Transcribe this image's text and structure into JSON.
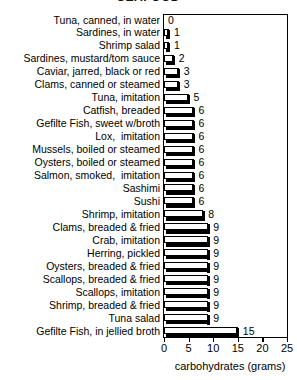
{
  "chart_data": {
    "type": "bar",
    "orientation": "horizontal",
    "title": "SEAFOOD",
    "title_cropped": true,
    "xlabel": "carbohydrates (grams)",
    "ylabel": "",
    "xlim": [
      0,
      25
    ],
    "xticks": [
      0,
      5,
      10,
      15,
      20,
      25
    ],
    "grid": false,
    "legend": false,
    "categories": [
      "Tuna, canned, in water",
      "Sardines, in water",
      "Shrimp salad",
      "Sardines, mustard/tom sauce",
      "Caviar, jarred, black or red",
      "Clams, canned or steamed",
      "Tuna, imitation",
      "Catfish, breaded",
      "Gefilte Fish, sweet w/broth",
      "Lox,  imitation",
      "Mussels, boiled or steamed",
      "Oysters, boiled or steamed",
      "Salmon, smoked,  imitation",
      "Sashimi",
      "Sushi",
      "Shrimp, imitation",
      "Clams, breaded & fried",
      "Crab, imitation",
      "Herring, pickled",
      "Oysters, breaded & fried",
      "Scallops, breaded & fried",
      "Scallops, imitation",
      "Shrimp, breaded & fried",
      "Tuna salad",
      "Gefilte Fish, in jellied broth"
    ],
    "values": [
      0,
      1,
      1,
      2,
      3,
      3,
      5,
      6,
      6,
      6,
      6,
      6,
      6,
      6,
      6,
      8,
      9,
      9,
      9,
      9,
      9,
      9,
      9,
      9,
      15
    ],
    "value_labels": [
      "0",
      "1",
      "1",
      "2",
      "3",
      "3",
      "5",
      "6",
      "6",
      "6",
      "6",
      "6",
      "6",
      "6",
      "6",
      "8",
      "9",
      "9",
      "9",
      "9",
      "9",
      "9",
      "9",
      "9",
      "15"
    ],
    "colors": {
      "bar_face": "#ffffff",
      "bar_outline": "#000000",
      "bar_shadow": "#000000",
      "frame": "#000000",
      "text": "#000000",
      "background": "#ffffff"
    }
  }
}
